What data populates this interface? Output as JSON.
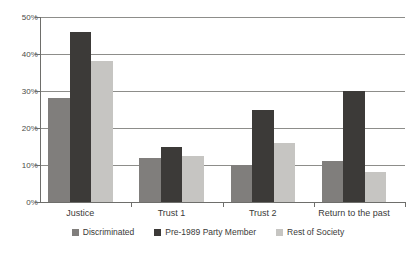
{
  "chart_data": {
    "type": "bar",
    "title": "",
    "subtitle": "",
    "xlabel": "",
    "ylabel": "",
    "categories": [
      "Justice",
      "Trust 1",
      "Trust 2",
      "Return to the past"
    ],
    "series": [
      {
        "name": "Discriminated",
        "color": "#807e7c",
        "values": [
          28,
          12,
          10,
          11
        ]
      },
      {
        "name": "Pre-1989 Party Member",
        "color": "#3c3a38",
        "values": [
          46,
          15,
          25,
          30
        ]
      },
      {
        "name": "Rest of Society",
        "color": "#c6c5c2",
        "values": [
          38,
          12.5,
          16,
          8
        ]
      }
    ],
    "ylim": [
      0,
      50
    ],
    "yticks": [
      0,
      10,
      20,
      30,
      40,
      50
    ],
    "ytick_labels": [
      "0%",
      "10%",
      "20%",
      "30%",
      "40%",
      "50%"
    ],
    "grid": true,
    "grid_axis": "y",
    "legend_position": "bottom",
    "value_suffix": "%"
  },
  "colors": {
    "grid": "#8d8d8a",
    "axis": "#6e6e6b",
    "text": "#3a3a38",
    "background": "#ffffff"
  }
}
